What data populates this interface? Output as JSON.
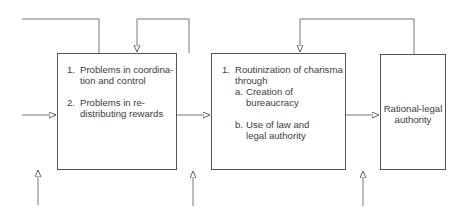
{
  "diagram": {
    "boxes": [
      {
        "id": "problems",
        "items": [
          {
            "num": "1.",
            "text": "Problems in coordina-",
            "text2": "tion and control"
          },
          {
            "num": "2.",
            "text": "Problems in re-",
            "text2": "distributing rewards"
          }
        ]
      },
      {
        "id": "routinization",
        "item": {
          "num": "1.",
          "text": "Routinization of charisma",
          "text2": "through"
        },
        "subitems": [
          {
            "num": "a.",
            "text": "Creation of",
            "text2": "bureaucracy"
          },
          {
            "num": "b.",
            "text": "Use of law and",
            "text2": "legal authority"
          }
        ]
      },
      {
        "id": "rational-legal",
        "text": "Rational-legal",
        "text2": "authority"
      }
    ],
    "colors": {
      "line": "#777777",
      "box_border": "#555555",
      "text": "#3d3d3d"
    }
  }
}
